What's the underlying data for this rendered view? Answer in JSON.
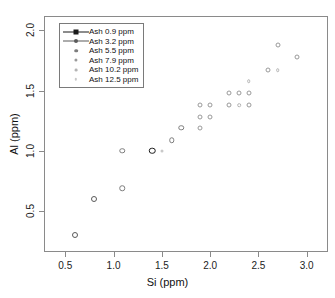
{
  "chart_data": {
    "type": "scatter",
    "title": "",
    "xlabel": "Si (ppm)",
    "ylabel": "Al (ppm)",
    "xlim": [
      0.28,
      3.22
    ],
    "ylim": [
      0.16,
      2.12
    ],
    "xticks": [
      0.5,
      1.0,
      1.5,
      2.0,
      2.5,
      3.0
    ],
    "xticklabels": [
      "0.5",
      "1.0",
      "1.5",
      "2.0",
      "2.5",
      "3.0"
    ],
    "yticks": [
      0.5,
      1.0,
      1.5,
      2.0
    ],
    "yticklabels": [
      "0.5",
      "1.0",
      "1.5",
      "2.0"
    ],
    "grid": false,
    "legend_position": "upper-left",
    "legend_title": "",
    "series": [
      {
        "name": "Ash 0.9 ppm",
        "color": "#1a1a1a",
        "marker": "circle",
        "size": 6.5,
        "points": [
          {
            "x": 1.4,
            "y": 1.0
          }
        ]
      },
      {
        "name": "Ash 3.2 ppm",
        "color": "#5a5a5a",
        "marker": "circle",
        "size": 6.0,
        "points": [
          {
            "x": 0.6,
            "y": 0.3
          },
          {
            "x": 0.8,
            "y": 0.6
          }
        ]
      },
      {
        "name": "Ash 5.5 ppm",
        "color": "#7d7d7d",
        "marker": "circle",
        "size": 5.5,
        "points": [
          {
            "x": 1.09,
            "y": 0.69
          },
          {
            "x": 1.09,
            "y": 1.0
          },
          {
            "x": 1.6,
            "y": 1.09
          },
          {
            "x": 1.7,
            "y": 1.19
          }
        ]
      },
      {
        "name": "Ash 7.9 ppm",
        "color": "#9a9a9a",
        "marker": "circle",
        "size": 5.0,
        "points": [
          {
            "x": 1.9,
            "y": 1.19
          },
          {
            "x": 1.9,
            "y": 1.28
          },
          {
            "x": 2.0,
            "y": 1.28
          },
          {
            "x": 1.9,
            "y": 1.38
          },
          {
            "x": 2.0,
            "y": 1.38
          },
          {
            "x": 2.2,
            "y": 1.38
          },
          {
            "x": 2.4,
            "y": 1.38
          },
          {
            "x": 2.2,
            "y": 1.48
          },
          {
            "x": 2.3,
            "y": 1.48
          },
          {
            "x": 2.4,
            "y": 1.48
          },
          {
            "x": 2.6,
            "y": 1.67
          },
          {
            "x": 2.7,
            "y": 1.88
          },
          {
            "x": 2.9,
            "y": 1.78
          }
        ]
      },
      {
        "name": "Ash 10.2 ppm",
        "color": "#b4b4b4",
        "marker": "circle",
        "size": 3.6,
        "points": [
          {
            "x": 2.3,
            "y": 1.38
          },
          {
            "x": 2.4,
            "y": 1.58
          },
          {
            "x": 2.7,
            "y": 1.67
          }
        ]
      },
      {
        "name": "Ash 12.5 ppm",
        "color": "#c9c9c9",
        "marker": "circle",
        "size": 3.0,
        "points": [
          {
            "x": 1.5,
            "y": 1.0
          }
        ]
      }
    ]
  },
  "axes": {
    "xlabel": "Si (ppm)",
    "ylabel": "Al (ppm)"
  },
  "legend": {
    "entries": [
      {
        "label": "Ash 0.9  ppm",
        "color": "#1a1a1a",
        "symbol": "square",
        "size": 5.0,
        "line": true
      },
      {
        "label": "Ash 3.2  ppm",
        "color": "#5a5a5a",
        "symbol": "circle",
        "size": 4.0,
        "line": true
      },
      {
        "label": "Ash 5.5  ppm",
        "color": "#7d7d7d",
        "symbol": "circle",
        "size": 3.6,
        "line": false
      },
      {
        "label": "Ash 7.9  ppm",
        "color": "#9a9a9a",
        "symbol": "circle",
        "size": 3.2,
        "line": false
      },
      {
        "label": "Ash 10.2  ppm",
        "color": "#b4b4b4",
        "symbol": "circle",
        "size": 2.8,
        "line": false
      },
      {
        "label": "Ash 12.5  ppm",
        "color": "#c9c9c9",
        "symbol": "circle",
        "size": 2.4,
        "line": false
      }
    ]
  }
}
